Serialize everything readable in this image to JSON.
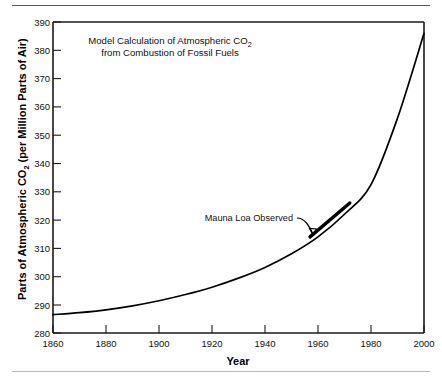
{
  "figure": {
    "top_rule": "horizontal-rule",
    "bottom_rule": "horizontal-rule"
  },
  "chart_data": {
    "type": "line",
    "title": "Model Calculation of Atmospheric CO2 from Combustion of Fossil Fuels",
    "title_line1_pre": "Model Calculation of Atmospheric CO",
    "title_line1_sub": "2",
    "title_line2": "from Combustion of Fossil Fuels",
    "xlabel": "Year",
    "ylabel": "Parts of Atmospheric CO2 (per Million Parts of Air)",
    "ylabel_pre": "Parts of Atmospheric CO",
    "ylabel_sub": "2",
    "ylabel_post": " (per Million Parts of Air)",
    "xlim": [
      1860,
      2000
    ],
    "ylim": [
      280,
      390
    ],
    "xticks": [
      1860,
      1880,
      1900,
      1920,
      1940,
      1960,
      1980,
      2000
    ],
    "xtick_labels": [
      "1860",
      "1880",
      "1900",
      "1920",
      "1940",
      "1960",
      "1980",
      "2000"
    ],
    "yticks": [
      280,
      290,
      300,
      310,
      320,
      330,
      340,
      350,
      360,
      370,
      380,
      390
    ],
    "ytick_labels": [
      "280",
      "290",
      "300",
      "310",
      "320",
      "330",
      "340",
      "350",
      "360",
      "370",
      "380",
      "390"
    ],
    "grid": false,
    "legend": "none",
    "series": [
      {
        "name": "Model Calculation",
        "x": [
          1860,
          1870,
          1880,
          1890,
          1900,
          1910,
          1920,
          1930,
          1940,
          1950,
          1960,
          1970,
          1980,
          1990,
          2000
        ],
        "values": [
          286.5,
          287.2,
          288.2,
          289.6,
          291.4,
          293.6,
          296.2,
          299.4,
          303.2,
          308.0,
          314.0,
          322.0,
          332.5,
          356.0,
          386.0
        ],
        "color": "#000000"
      },
      {
        "name": "Mauna Loa Observed",
        "x": [
          1957,
          1972
        ],
        "values": [
          314.0,
          326.0
        ],
        "color": "#000000"
      }
    ],
    "annotations": [
      {
        "text": "Mauna Loa Observed",
        "points_to": "Mauna Loa Observed segment"
      }
    ]
  }
}
